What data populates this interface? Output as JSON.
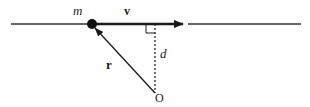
{
  "diagram": {
    "labels": {
      "mass": "m",
      "velocity": "v",
      "distance": "d",
      "position": "r",
      "origin": "O"
    },
    "colors": {
      "ink": "#1a1a1a",
      "background": "#ffffff"
    }
  }
}
